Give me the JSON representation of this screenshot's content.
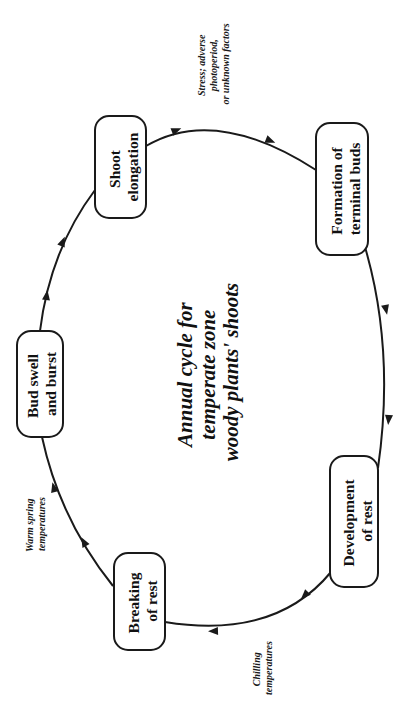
{
  "diagram": {
    "orientation": "rotated -90 degrees",
    "title": {
      "lines": [
        "Annual cycle for",
        "temperate zone",
        "woody plants' shoots"
      ]
    },
    "stages": [
      {
        "id": "shoot-elongation",
        "lines": [
          "Shoot",
          "elongation"
        ]
      },
      {
        "id": "formation-terminal-buds",
        "lines": [
          "Formation of",
          "terminal buds"
        ]
      },
      {
        "id": "development-of-rest",
        "lines": [
          "Development",
          "of rest"
        ]
      },
      {
        "id": "breaking-of-rest",
        "lines": [
          "Breaking",
          "of rest"
        ]
      },
      {
        "id": "bud-swell-burst",
        "lines": [
          "Bud swell",
          "and burst"
        ]
      }
    ],
    "conditions": [
      {
        "id": "stress",
        "between": [
          "shoot-elongation",
          "formation-terminal-buds"
        ],
        "lines": [
          "Stress; adverse",
          "photoperiod,",
          "or unknown factors"
        ]
      },
      {
        "id": "chilling",
        "between": [
          "development-of-rest",
          "breaking-of-rest"
        ],
        "lines": [
          "Chilling",
          "temperatures"
        ]
      },
      {
        "id": "warm-spring",
        "between": [
          "breaking-of-rest",
          "bud-swell-burst"
        ],
        "lines": [
          "Warm spring",
          "temperatures"
        ]
      }
    ],
    "flow": [
      "shoot-elongation",
      "formation-terminal-buds",
      "development-of-rest",
      "breaking-of-rest",
      "bud-swell-burst",
      "shoot-elongation"
    ],
    "colors": {
      "ink": "#1a1a1a",
      "background": "#ffffff"
    }
  }
}
